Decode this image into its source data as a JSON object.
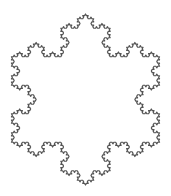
{
  "figure": {
    "type": "fractal-curve",
    "iterations": 4,
    "center": [
      85.5,
      99.5
    ],
    "outer_radius": 85.5,
    "first_vertex_angle_deg": -90,
    "stroke_color": "#555555",
    "stroke_width": 1.2,
    "fill_color": "#ffffff",
    "background_color": "#ffffff"
  }
}
